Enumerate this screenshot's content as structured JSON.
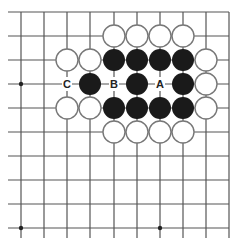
{
  "diagram": {
    "type": "go-board-diagram",
    "grid": {
      "columns_x": [
        21,
        44,
        67,
        90,
        114,
        137,
        160,
        183,
        206,
        229
      ],
      "rows_y": [
        12,
        36,
        60,
        84,
        108,
        132,
        156,
        180,
        204,
        228
      ],
      "open_left": true,
      "open_bottom": true,
      "edge_top": true,
      "edge_right": true,
      "line_color": "#555555",
      "hoshi": [
        [
          0,
          3
        ],
        [
          0,
          9
        ],
        [
          6,
          9
        ]
      ]
    },
    "stones": {
      "black_color": "#1a1a1a",
      "white_fill": "#ffffff",
      "white_stroke": "#777777",
      "black": [
        [
          4,
          2
        ],
        [
          5,
          2
        ],
        [
          6,
          2
        ],
        [
          7,
          2
        ],
        [
          3,
          3
        ],
        [
          5,
          3
        ],
        [
          7,
          3
        ],
        [
          4,
          4
        ],
        [
          5,
          4
        ],
        [
          6,
          4
        ],
        [
          7,
          4
        ]
      ],
      "white": [
        [
          4,
          1
        ],
        [
          5,
          1
        ],
        [
          6,
          1
        ],
        [
          7,
          1
        ],
        [
          2,
          2
        ],
        [
          3,
          2
        ],
        [
          8,
          2
        ],
        [
          8,
          3
        ],
        [
          2,
          4
        ],
        [
          3,
          4
        ],
        [
          8,
          4
        ],
        [
          4,
          5
        ],
        [
          5,
          5
        ],
        [
          6,
          5
        ],
        [
          7,
          5
        ]
      ]
    },
    "labels": [
      {
        "text": "C",
        "col": 2,
        "row": 3
      },
      {
        "text": "B",
        "col": 4,
        "row": 3
      },
      {
        "text": "A",
        "col": 6,
        "row": 3
      }
    ]
  }
}
